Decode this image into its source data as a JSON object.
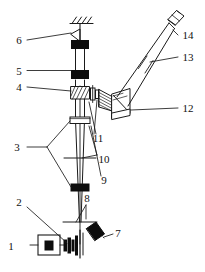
{
  "figure": {
    "type": "optical-system-schematic",
    "title": "",
    "background_color": "#ffffff",
    "line_color": "#1a1a1a",
    "fill_color": "#000000",
    "width": 205,
    "height": 272
  },
  "callouts": [
    {
      "id": "1",
      "label": "1",
      "x": 11,
      "y": 247,
      "component": "laser-source"
    },
    {
      "id": "2",
      "label": "2",
      "x": 19,
      "y": 202,
      "component": "beam-expander-optics"
    },
    {
      "id": "3",
      "label": "3",
      "x": 17,
      "y": 150,
      "component": "lens-pair"
    },
    {
      "id": "4",
      "label": "4",
      "x": 19,
      "y": 90,
      "component": "beamsplitter-plate"
    },
    {
      "id": "5",
      "label": "5",
      "x": 19,
      "y": 74,
      "component": "upper-lens"
    },
    {
      "id": "6",
      "label": "6",
      "x": 19,
      "y": 43,
      "component": "ceiling-mount-bracket"
    },
    {
      "id": "7",
      "label": "7",
      "x": 109,
      "y": 239,
      "component": "folding-mirror"
    },
    {
      "id": "8",
      "label": "8",
      "x": 90,
      "y": 203,
      "component": "objective-lens"
    },
    {
      "id": "9",
      "label": "9",
      "x": 104,
      "y": 180,
      "component": "beam-axis"
    },
    {
      "id": "10",
      "label": "10",
      "x": 103,
      "y": 159,
      "component": "field-stop"
    },
    {
      "id": "11",
      "label": "11",
      "x": 98,
      "y": 139,
      "component": "relay-lens"
    },
    {
      "id": "12",
      "label": "12",
      "x": 184,
      "y": 110,
      "component": "periscope-prism"
    },
    {
      "id": "13",
      "label": "13",
      "x": 184,
      "y": 59,
      "component": "telescope-tube"
    },
    {
      "id": "14",
      "label": "14",
      "x": 184,
      "y": 37,
      "component": "output-window"
    }
  ],
  "components": [
    {
      "name": "ceiling-hatch",
      "desc": "hatched ceiling fixing line at top"
    },
    {
      "name": "support-bracket",
      "desc": "triangular support under ceiling"
    },
    {
      "name": "collar-block-top",
      "desc": "solid black collar on vertical column"
    },
    {
      "name": "upper-lens-block",
      "desc": "solid black lens mount, label 5"
    },
    {
      "name": "beamsplitter",
      "desc": "hatched tilted plate, label 4"
    },
    {
      "name": "mid-collar",
      "desc": "open rectangular collar on column"
    },
    {
      "name": "lower-collar",
      "desc": "solid black collar, lower column"
    },
    {
      "name": "objective-lens-line",
      "desc": "horizontal lens line, label 8"
    },
    {
      "name": "field-stop-line",
      "desc": "horizontal stop line, label 10"
    },
    {
      "name": "fold-mirror",
      "desc": "thick diagonal black bar, label 7"
    },
    {
      "name": "laser-box",
      "desc": "rectangle with inner black slab, label 1"
    },
    {
      "name": "expander-stack",
      "desc": "stack of thin lens plates, label 2"
    },
    {
      "name": "relay-lens-small",
      "desc": "small vertical lens right of splitter, label 11"
    },
    {
      "name": "wedge-prism",
      "desc": "hatched wedge/cone element, label 10 side"
    },
    {
      "name": "periscope-prism",
      "desc": "hatched right-angle prism block, label 12"
    },
    {
      "name": "telescope-barrel",
      "desc": "inclined parallel-line tube, label 13"
    },
    {
      "name": "barrel-band",
      "desc": "cross band on telescope tube"
    },
    {
      "name": "output-window",
      "desc": "small angled rectangular window, label 14"
    }
  ]
}
